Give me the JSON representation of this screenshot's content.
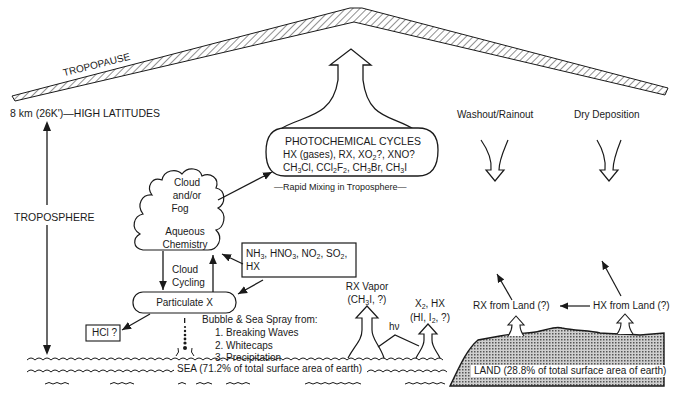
{
  "tropopause": {
    "label": "TROPOPAUSE"
  },
  "altitude": {
    "label": "8 km (26K')—HIGH LATITUDES"
  },
  "troposphere": {
    "label": "TROPOSPHERE"
  },
  "photochemical": {
    "title": "PHOTOCHEMICAL CYCLES",
    "line1": "HX (gases), RX, XO2?, XNO?",
    "line2": "CH3Cl, CCl2F2, CH3Br, CH3I",
    "caption": "—Rapid Mixing in Troposphere—"
  },
  "cloud": {
    "line1": "Cloud",
    "line2": "and/or",
    "line3": "Fog",
    "line4": "Aqueous",
    "line5": "Chemistry"
  },
  "gases_box": {
    "line1": "NH3, HNO3, NO2, SO2,",
    "line2": "HX"
  },
  "cloud_cycling": {
    "line1": "Cloud",
    "line2": "Cycling"
  },
  "particulate": {
    "label": "Particulate X"
  },
  "hcl": {
    "label": "HCl ?"
  },
  "sea_spray": {
    "title": "Bubble & Sea Spray from:",
    "items": [
      "1.  Breaking Waves",
      "2.  Whitecaps",
      "3.  Precipitation"
    ]
  },
  "rx_vapor": {
    "line1": "RX Vapor",
    "line2": "(CH3I, ?)"
  },
  "x2_hx": {
    "line1": "X2, HX",
    "line2": "(HI, I2, ?)"
  },
  "hv": {
    "label": "hν"
  },
  "washout": {
    "label": "Washout/Rainout"
  },
  "dry_deposition": {
    "label": "Dry Deposition"
  },
  "rx_land": {
    "label": "RX from Land (?)"
  },
  "hx_land": {
    "label": "HX from Land (?)"
  },
  "sea": {
    "label": "SEA (71.2% of total surface area of earth)"
  },
  "land": {
    "label": "LAND (28.8% of total surface area of earth)"
  }
}
